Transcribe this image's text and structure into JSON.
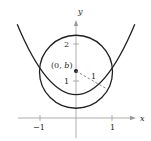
{
  "diagram": {
    "axes": {
      "x_label": "x",
      "y_label": "y",
      "x_ticks": [
        {
          "value": -1,
          "label": "−1"
        },
        {
          "value": 1,
          "label": "1"
        }
      ],
      "y_ticks": [
        {
          "value": 1,
          "label": "1"
        },
        {
          "value": 2,
          "label": "2"
        }
      ]
    },
    "center_point": {
      "label": "(0, b)",
      "x": 0,
      "y": 1.25
    },
    "radius_label": "1",
    "circle": {
      "center": [
        0,
        1.25
      ],
      "radius": 1
    },
    "parabola": {
      "equation": "y = x^2"
    },
    "colors": {
      "curve": "#231f20",
      "axis": "#999999",
      "dashed": "#777777"
    }
  }
}
